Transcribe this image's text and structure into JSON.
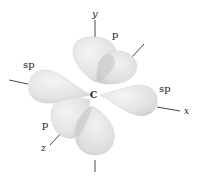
{
  "diagram": {
    "center_atom": "C",
    "axes": {
      "x": "x",
      "y": "y",
      "z": "z"
    },
    "orbital_labels": {
      "sp_left": "sp",
      "sp_right": "sp",
      "p_top": "p",
      "p_bottom": "p"
    },
    "colors": {
      "lobe_fill": "#e6e6e6",
      "lobe_shade": "#c9c9c9",
      "overlap": "#bdbdbd",
      "axis": "#333333",
      "text": "#222222"
    }
  }
}
